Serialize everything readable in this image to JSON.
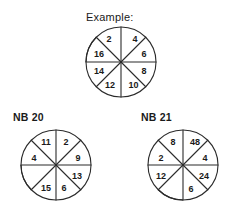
{
  "page": {
    "background_color": "#ffffff",
    "ink_color": "#2b2b2b"
  },
  "example": {
    "label": "Example:",
    "wheel": {
      "name": "example-wheel",
      "radius": 35,
      "sector_count": 8,
      "sectors": [
        {
          "position": "top-right",
          "value": "4"
        },
        {
          "position": "right-upper",
          "value": "6"
        },
        {
          "position": "right-lower",
          "value": "8"
        },
        {
          "position": "bottom-right",
          "value": "10"
        },
        {
          "position": "bottom-left",
          "value": "12"
        },
        {
          "position": "left-lower",
          "value": "14"
        },
        {
          "position": "left-upper",
          "value": "16"
        },
        {
          "position": "top-left",
          "value": "2"
        }
      ]
    }
  },
  "problems": [
    {
      "label": "NB 20",
      "wheel": {
        "name": "nb20-wheel",
        "radius": 35,
        "sector_count": 8,
        "sectors": [
          {
            "position": "top-right",
            "value": "2"
          },
          {
            "position": "right-upper",
            "value": "9"
          },
          {
            "position": "right-lower",
            "value": "13"
          },
          {
            "position": "bottom-right",
            "value": "6"
          },
          {
            "position": "bottom-left",
            "value": "15"
          },
          {
            "position": "left-lower",
            "value": ""
          },
          {
            "position": "left-upper",
            "value": "4"
          },
          {
            "position": "top-left",
            "value": "11"
          }
        ]
      }
    },
    {
      "label": "NB 21",
      "wheel": {
        "name": "nb21-wheel",
        "radius": 35,
        "sector_count": 8,
        "sectors": [
          {
            "position": "top-right",
            "value": "48"
          },
          {
            "position": "right-upper",
            "value": "4"
          },
          {
            "position": "right-lower",
            "value": "24"
          },
          {
            "position": "bottom-right",
            "value": "6"
          },
          {
            "position": "bottom-left",
            "value": ""
          },
          {
            "position": "left-lower",
            "value": "12"
          },
          {
            "position": "left-upper",
            "value": "2"
          },
          {
            "position": "top-left",
            "value": "8"
          }
        ]
      }
    }
  ]
}
